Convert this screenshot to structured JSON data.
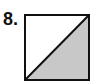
{
  "problem": {
    "number_label": "8."
  },
  "figure": {
    "shape": "square",
    "divider": "diagonal from bottom-left to top-right",
    "shaded_region": "lower-right triangle",
    "shaded_fraction": "1/2",
    "colors": {
      "stroke": "#111111",
      "shade": "#c8c8c8",
      "background": "#ffffff"
    }
  }
}
